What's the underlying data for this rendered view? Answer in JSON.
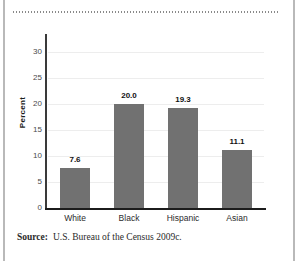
{
  "figure": {
    "clipped_header_text": "",
    "source_label": "Source:",
    "source_text": "U.S. Bureau of the Census 2009c."
  },
  "chart_data": {
    "type": "bar",
    "title": "",
    "subtitle": "",
    "categories": [
      "White",
      "Black",
      "Hispanic",
      "Asian"
    ],
    "values": [
      7.6,
      20.0,
      19.3,
      11.1
    ],
    "value_labels": [
      "7.6",
      "20.0",
      "19.3",
      "11.1"
    ],
    "series": [
      {
        "name": "Percent",
        "values": [
          7.6,
          20.0,
          19.3,
          11.1
        ]
      }
    ],
    "xlabel": "",
    "ylabel": "Percent",
    "ylim": [
      0,
      30
    ],
    "ytick_labels": [
      "0",
      "5",
      "10",
      "15",
      "20",
      "25",
      "30"
    ],
    "ytick_values": [
      0,
      5,
      10,
      15,
      20,
      25,
      30
    ],
    "grid": true,
    "legend": false,
    "legend_position": "none",
    "bar_color": "#717171",
    "grid_color": "#ededed",
    "axis_color": "#1c1c1c",
    "background": "#ffffff"
  }
}
